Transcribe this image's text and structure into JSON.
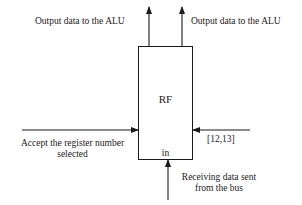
{
  "diagram": {
    "block": {
      "title": "RF",
      "port_label": "in"
    },
    "outputs": [
      {
        "label": "Output data to the ALU"
      },
      {
        "label": "Output data to the ALU"
      }
    ],
    "inputs": {
      "left": {
        "line1": "Accept the register number",
        "line2": "selected"
      },
      "right": {
        "label": "[12,13]"
      },
      "bottom": {
        "line1": "Receiving data sent",
        "line2": "from the bus"
      }
    },
    "colors": {
      "stroke": "#1a1a1a",
      "background": "#ffffff"
    }
  }
}
